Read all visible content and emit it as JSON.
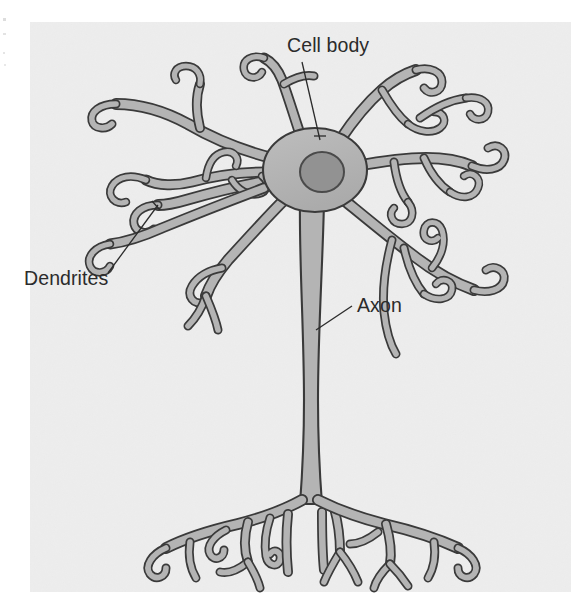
{
  "figure": {
    "panel": {
      "background_color": "#eeeeee",
      "x": 30,
      "y": 22,
      "width": 541,
      "height": 570
    },
    "page_background_color": "#ffffff",
    "cell_fill_color": "#b4b4b4",
    "cell_outline_color": "#3a3a3a",
    "nucleus_fill_color": "#929292",
    "label_color": "#2b2b2b",
    "leader_line_color": "#2b2b2b"
  },
  "labels": [
    {
      "id": "cell-body",
      "text": "Cell body",
      "text_x": 287,
      "text_y": 52,
      "leader": {
        "x1": 302,
        "y1": 62,
        "x2": 320,
        "y2": 140
      }
    },
    {
      "id": "dendrites",
      "text": "Dendrites",
      "text_x": 24,
      "text_y": 285,
      "leader": {
        "x1": 108,
        "y1": 273,
        "x2": 158,
        "y2": 205
      }
    },
    {
      "id": "axon",
      "text": "Axon",
      "text_x": 357,
      "text_y": 312,
      "leader": {
        "x1": 352,
        "y1": 306,
        "x2": 316,
        "y2": 330
      }
    }
  ],
  "structures": {
    "soma": {
      "center_x": 315,
      "center_y": 170,
      "radius_x": 52,
      "radius_y": 42
    },
    "nucleus": {
      "center_x": 322,
      "center_y": 172,
      "radius_x": 22,
      "radius_y": 20
    },
    "axon": {
      "top_y": 210,
      "bottom_y": 505,
      "x": 310,
      "width": 14
    },
    "dendrite_count": 8,
    "terminal_count": 11
  }
}
